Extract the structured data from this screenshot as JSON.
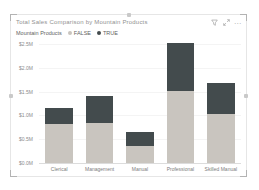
{
  "visual": {
    "title": "Total Sales Comparison by Mountain Products",
    "selected": true,
    "header_icons": [
      {
        "name": "filter-icon"
      },
      {
        "name": "focus-mode-icon"
      },
      {
        "name": "more-options-icon",
        "glyph": "..."
      }
    ]
  },
  "legend": {
    "label": "Mountain Products"
  },
  "colors": {
    "series_false": "#c9c5bf",
    "series_true": "#434b4d",
    "card_border": "#e6e6e6",
    "axis_text": "#8c8c8c"
  },
  "chart_data": {
    "type": "bar",
    "stacked": true,
    "title": "Total Sales Comparison by Mountain Products",
    "categories": [
      "Clerical",
      "Management",
      "Manual",
      "Professional",
      "Skilled Manual"
    ],
    "series": [
      {
        "name": "FALSE",
        "color": "#c9c5bf",
        "values": [
          0.82,
          0.84,
          0.36,
          1.51,
          1.03
        ]
      },
      {
        "name": "TRUE",
        "color": "#434b4d",
        "values": [
          0.34,
          0.57,
          0.29,
          1.02,
          0.65
        ]
      }
    ],
    "xlabel": "",
    "ylabel": "",
    "unit": "$M",
    "ylim": [
      0,
      2.5
    ],
    "yticks": [
      "$0.0M",
      "$0.5M",
      "$1.0M",
      "$1.5M",
      "$2.0M",
      "$2.5M"
    ],
    "legend_title": "Mountain Products",
    "legend_position": "top",
    "grid": false
  }
}
